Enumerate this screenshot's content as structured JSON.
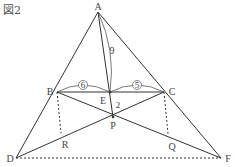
{
  "figure": {
    "title": "図2",
    "points": {
      "A": {
        "label": "A",
        "x": 98,
        "y": 12
      },
      "B": {
        "label": "B",
        "x": 57,
        "y": 92
      },
      "C": {
        "label": "C",
        "x": 164,
        "y": 92
      },
      "E": {
        "label": "E",
        "x": 110,
        "y": 92
      },
      "P": {
        "label": "P",
        "x": 113,
        "y": 117
      },
      "D": {
        "label": "D",
        "x": 16,
        "y": 158
      },
      "F": {
        "label": "F",
        "x": 221,
        "y": 158
      },
      "R": {
        "label": "R",
        "x": 61,
        "y": 136
      },
      "Q": {
        "label": "Q",
        "x": 171,
        "y": 138
      }
    },
    "lengths": {
      "BE": "6",
      "EC": "5",
      "AE": "9",
      "EP": "2"
    },
    "colors": {
      "line": "#333333",
      "text": "#444444"
    }
  }
}
